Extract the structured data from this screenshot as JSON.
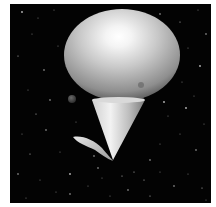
{
  "image": {
    "description": "Grayscale 3D render of an ellipsoid balloon above an inverted cone with a small leaf-like fin, against a starfield",
    "background_color": "#030303",
    "border_color": "#ffffff"
  },
  "objects": {
    "balloon": {
      "shape": "ellipsoid",
      "cx": 112,
      "cy": 51,
      "rx": 58,
      "ry": 46,
      "highlight_color": "#ffffff",
      "base_color": "#bdbdbd",
      "shadow_color": "#4a4a4a"
    },
    "cone": {
      "shape": "inverted-cone",
      "top_y": 96,
      "left_x": 82,
      "right_x": 135,
      "tip_x": 103,
      "tip_y": 156
    },
    "fin": {
      "shape": "leaf",
      "from": [
        63,
        133
      ],
      "to": [
        103,
        157
      ]
    },
    "small_spheres": [
      {
        "cx": 62,
        "cy": 95,
        "r": 4
      },
      {
        "cx": 130,
        "cy": 94,
        "r": 4
      },
      {
        "cx": 131,
        "cy": 81,
        "r": 3
      }
    ]
  },
  "stars": [
    [
      12,
      8
    ],
    [
      28,
      14
    ],
    [
      44,
      6
    ],
    [
      150,
      10
    ],
    [
      170,
      18
    ],
    [
      188,
      6
    ],
    [
      196,
      30
    ],
    [
      22,
      30
    ],
    [
      8,
      52
    ],
    [
      34,
      66
    ],
    [
      48,
      42
    ],
    [
      178,
      44
    ],
    [
      190,
      62
    ],
    [
      172,
      78
    ],
    [
      18,
      86
    ],
    [
      40,
      96
    ],
    [
      26,
      110
    ],
    [
      12,
      130
    ],
    [
      36,
      126
    ],
    [
      50,
      148
    ],
    [
      20,
      150
    ],
    [
      8,
      170
    ],
    [
      30,
      176
    ],
    [
      46,
      188
    ],
    [
      60,
      170
    ],
    [
      78,
      182
    ],
    [
      92,
      174
    ],
    [
      118,
      186
    ],
    [
      134,
      176
    ],
    [
      150,
      168
    ],
    [
      164,
      182
    ],
    [
      178,
      170
    ],
    [
      192,
      184
    ],
    [
      186,
      146
    ],
    [
      170,
      130
    ],
    [
      158,
      112
    ],
    [
      176,
      104
    ],
    [
      194,
      120
    ],
    [
      150,
      140
    ],
    [
      140,
      156
    ],
    [
      124,
      168
    ],
    [
      66,
      118
    ],
    [
      84,
      152
    ],
    [
      100,
      192
    ],
    [
      140,
      192
    ],
    [
      60,
      190
    ],
    [
      16,
      194
    ],
    [
      196,
      196
    ],
    [
      154,
      98
    ],
    [
      56,
      62
    ],
    [
      184,
      92
    ],
    [
      88,
      164
    ],
    [
      112,
      172
    ]
  ]
}
